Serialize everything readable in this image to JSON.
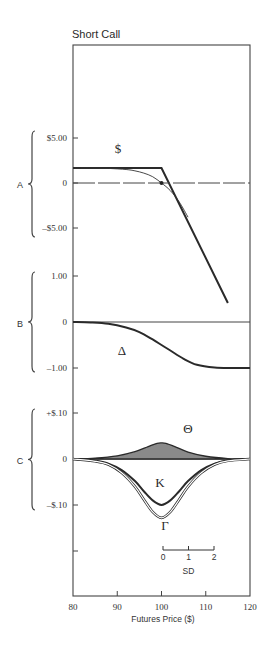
{
  "chart_data": {
    "type": "line",
    "title": "Short Call",
    "xlabel": "Futures Price ($)",
    "xlim": [
      80,
      120
    ],
    "x_ticks": [
      80,
      90,
      100,
      110,
      120
    ],
    "x_tick_labels": [
      "80",
      "90",
      "100",
      "110",
      "120"
    ],
    "strike": 100,
    "panels": [
      {
        "id": "A",
        "label": "A",
        "ylim": [
          -5,
          5
        ],
        "y_ticks": [
          5,
          0,
          -5
        ],
        "y_tick_labels": [
          "$5.00",
          "0",
          "–$5.00"
        ],
        "series": [
          {
            "name": "expiration-payoff",
            "label": "$",
            "style": "thick",
            "x": [
              80,
              100,
              115
            ],
            "y": [
              1.67,
              1.67,
              -13.33
            ]
          },
          {
            "name": "current-value",
            "style": "thin",
            "x": [
              80,
              84,
              88,
              92,
              94,
              96,
              98,
              100,
              102,
              104,
              106
            ],
            "y": [
              1.67,
              1.66,
              1.62,
              1.5,
              1.35,
              1.1,
              0.7,
              0.0,
              -0.85,
              -2.1,
              -3.8
            ]
          },
          {
            "name": "zero-line",
            "style": "dashed",
            "x": [
              80,
              120
            ],
            "y": [
              0,
              0
            ]
          }
        ],
        "marker": {
          "x": 100,
          "y": 0
        }
      },
      {
        "id": "B",
        "label": "B",
        "ylim": [
          -1,
          1
        ],
        "y_ticks": [
          1,
          0,
          -1
        ],
        "y_tick_labels": [
          "1.00",
          "0",
          "–1.00"
        ],
        "series": [
          {
            "name": "delta",
            "label": "Δ",
            "style": "thick",
            "x": [
              80,
              84,
              88,
              92,
              95,
              98,
              100,
              102,
              105,
              108,
              112,
              116,
              120
            ],
            "y": [
              0,
              -0.01,
              -0.04,
              -0.12,
              -0.22,
              -0.38,
              -0.5,
              -0.62,
              -0.8,
              -0.93,
              -0.99,
              -1.0,
              -1.0
            ]
          }
        ]
      },
      {
        "id": "C",
        "label": "C",
        "ylim": [
          -0.2,
          0.1
        ],
        "y_ticks": [
          0.1,
          0,
          -0.1,
          -0.2
        ],
        "y_tick_labels": [
          "+$.10",
          "0",
          "–$.10",
          ""
        ],
        "series": [
          {
            "name": "theta",
            "label": "Θ",
            "style": "filled",
            "x": [
              80,
              85,
              90,
              94,
              97,
              99,
              100,
              101,
              103,
              106,
              110,
              115,
              120
            ],
            "y": [
              0,
              0.002,
              0.007,
              0.016,
              0.027,
              0.034,
              0.035,
              0.034,
              0.027,
              0.015,
              0.006,
              0.001,
              0
            ]
          },
          {
            "name": "kappa",
            "label": "K",
            "style": "thick",
            "x": [
              80,
              85,
              88,
              91,
              94,
              96,
              98,
              100,
              102,
              104,
              106,
              109,
              112,
              115,
              120
            ],
            "y": [
              0,
              -0.004,
              -0.01,
              -0.024,
              -0.048,
              -0.07,
              -0.09,
              -0.1,
              -0.09,
              -0.07,
              -0.048,
              -0.024,
              -0.01,
              -0.003,
              0
            ]
          },
          {
            "name": "gamma",
            "label": "Γ",
            "style": "double-thin",
            "x": [
              80,
              85,
              88,
              91,
              94,
              96,
              98,
              100,
              102,
              104,
              106,
              109,
              112,
              115,
              120
            ],
            "y": [
              0,
              -0.005,
              -0.012,
              -0.03,
              -0.06,
              -0.088,
              -0.115,
              -0.128,
              -0.115,
              -0.088,
              -0.06,
              -0.03,
              -0.012,
              -0.004,
              0
            ]
          }
        ],
        "sd_scale": {
          "label": "SD",
          "ticks": [
            "0",
            "1",
            "2"
          ]
        }
      }
    ]
  }
}
